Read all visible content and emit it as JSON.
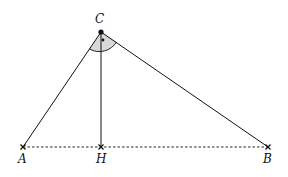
{
  "diagram": {
    "points": {
      "A": {
        "label": "A",
        "x": 23,
        "y": 147
      },
      "H": {
        "label": "H",
        "x": 101,
        "y": 147
      },
      "B": {
        "label": "B",
        "x": 268,
        "y": 147
      },
      "C": {
        "label": "C",
        "x": 101,
        "y": 32
      }
    },
    "segments": [
      {
        "from": "C",
        "to": "A",
        "style": "solid"
      },
      {
        "from": "C",
        "to": "B",
        "style": "solid"
      },
      {
        "from": "C",
        "to": "H",
        "style": "solid"
      },
      {
        "from": "A",
        "to": "B",
        "style": "dashed"
      }
    ],
    "angle_mark": {
      "vertex": "C",
      "type": "right-angle-arc",
      "fill": "#d8d8d8"
    },
    "colors": {
      "stroke": "#111111",
      "shade": "#d8d8d8"
    }
  }
}
